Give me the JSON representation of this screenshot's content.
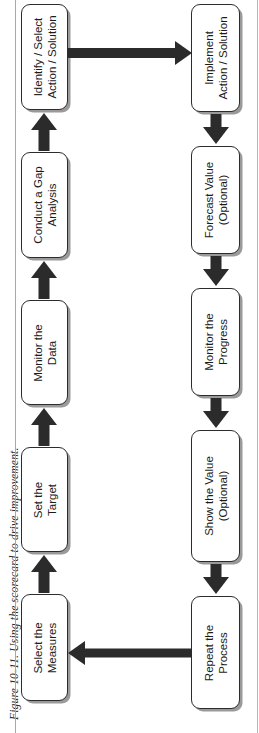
{
  "caption": {
    "text": "Figure 10-11.  Using the scorecard to drive improvement."
  },
  "colors": {
    "box_border": "#2c2c2c",
    "box_fill": "#ffffff",
    "shadow": "#9a9a9a",
    "arrow": "#2b2b2b",
    "rule": "#a8a8a8",
    "text": "#1b1b1b"
  },
  "diagram": {
    "type": "process-flow",
    "orientation": "rotated-90-ccw",
    "row_top": {
      "direction": "right-to-left-on-page",
      "nodes": [
        {
          "id": "select-measures",
          "line1": "Select the",
          "line2": "Measures"
        },
        {
          "id": "set-target",
          "line1": "Set the",
          "line2": "Target"
        },
        {
          "id": "monitor-data",
          "line1": "Monitor the",
          "line2": "Data"
        },
        {
          "id": "conduct-gap",
          "line1": "Conduct a Gap",
          "line2": "Analysis"
        },
        {
          "id": "identify-select",
          "line1": "Identify / Select",
          "line2": "Action / Solution"
        }
      ]
    },
    "row_bottom": {
      "direction": "left-to-right-on-page",
      "nodes": [
        {
          "id": "implement-action",
          "line1": "Implement",
          "line2": "Action / Solution"
        },
        {
          "id": "forecast-value",
          "line1": "Forecast Value",
          "line2": "(Optional)"
        },
        {
          "id": "monitor-progress",
          "line1": "Monitor the",
          "line2": "Progress"
        },
        {
          "id": "show-value",
          "line1": "Show the Value",
          "line2": "(Optional)"
        },
        {
          "id": "repeat-process",
          "line1": "Repeat the",
          "line2": "Process"
        }
      ]
    },
    "connectors": {
      "row_top_arrows": 4,
      "row_bottom_arrows": 4,
      "crossover_arrow": "identify-select -> implement-action",
      "feedback_arrow": "repeat-process -> select-measures"
    }
  }
}
